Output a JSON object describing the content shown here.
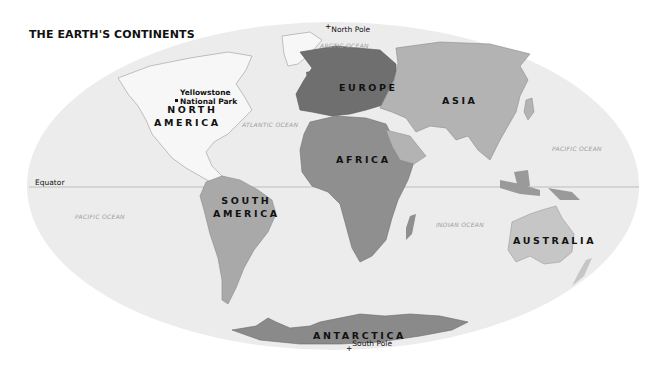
{
  "title": "THE EARTH'S CONTINENTS",
  "colors": {
    "ocean": "#ececec",
    "north_america": "#f7f7f7",
    "south_america": "#a9a9a9",
    "europe": "#6f6f6f",
    "asia": "#b3b3b3",
    "africa": "#8f8f8f",
    "australia": "#c6c6c6",
    "antarctica": "#8a8a8a",
    "equator_line": "#bdbdbd"
  },
  "continents": {
    "north_america": [
      "NORTH",
      "AMERICA"
    ],
    "south_america": [
      "SOUTH",
      "AMERICA"
    ],
    "europe": "EUROPE",
    "asia": "ASIA",
    "africa": "AFRICA",
    "australia": "AUSTRALIA",
    "antarctica": "ANTARCTICA"
  },
  "oceans": {
    "arctic": "ARCTIC OCEAN",
    "atlantic": "ATLANTIC OCEAN",
    "pacific_east": "PACIFIC OCEAN",
    "pacific_west": "PACIFIC OCEAN",
    "indian": "INDIAN OCEAN"
  },
  "markers": {
    "north_pole": "North Pole",
    "south_pole": "South Pole",
    "equator": "Equator",
    "yellowstone": [
      "Yellowstone",
      "National Park"
    ]
  }
}
